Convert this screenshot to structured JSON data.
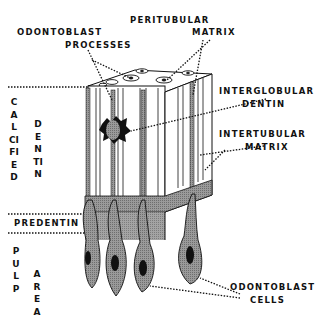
{
  "diagram": {
    "labels": {
      "peritubular_matrix": [
        "PERITUBULAR",
        "MATRIX"
      ],
      "odontoblast_processes": [
        "ODONTOBLAST",
        "PROCESSES"
      ],
      "interglobular_dentin": [
        "INTERGLOBULAR",
        "DENTIN"
      ],
      "intertubular_matrix": [
        "INTERTUBULAR",
        "MATRIX"
      ],
      "predentin": "PREDENTIN",
      "odontoblast_cells": [
        "ODONTOBLAST",
        "CELLS"
      ],
      "calcified": "CALCIFIED",
      "dentin_side": "DENTIN",
      "pulp": "PULP",
      "area": "AREA"
    },
    "colors": {
      "ink": "#111111",
      "tissue_gray": "#8a8a8a",
      "nucleus": "#1a1a1a",
      "background": "#ffffff"
    }
  }
}
